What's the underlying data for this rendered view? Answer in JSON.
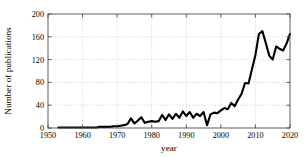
{
  "chart_data": {
    "type": "line",
    "title": "",
    "xlabel": "year",
    "ylabel": "Number of publications",
    "xlim": [
      1950,
      2020
    ],
    "ylim": [
      0,
      200
    ],
    "xticks": [
      1950,
      1960,
      1970,
      1980,
      1990,
      2000,
      2010,
      2020
    ],
    "yticks": [
      0,
      40,
      80,
      120,
      160,
      200
    ],
    "grid": true,
    "legend": null,
    "line_color": "#000000",
    "series": [
      {
        "name": "publications",
        "x": [
          1953,
          1954,
          1955,
          1956,
          1957,
          1958,
          1959,
          1960,
          1961,
          1962,
          1963,
          1964,
          1965,
          1966,
          1967,
          1968,
          1969,
          1970,
          1971,
          1972,
          1973,
          1974,
          1975,
          1976,
          1977,
          1978,
          1979,
          1980,
          1981,
          1982,
          1983,
          1984,
          1985,
          1986,
          1987,
          1988,
          1989,
          1990,
          1991,
          1992,
          1993,
          1994,
          1995,
          1996,
          1997,
          1998,
          1999,
          2000,
          2001,
          2002,
          2003,
          2004,
          2005,
          2006,
          2007,
          2008,
          2009,
          2010,
          2011,
          2012,
          2013,
          2014,
          2015,
          2016,
          2017,
          2018,
          2019,
          2020
        ],
        "values": [
          1,
          1,
          1,
          1,
          1,
          1,
          1,
          1,
          1,
          1,
          1,
          1,
          2,
          2,
          2,
          2,
          3,
          3,
          4,
          5,
          7,
          17,
          8,
          13,
          19,
          9,
          11,
          12,
          11,
          12,
          23,
          14,
          24,
          16,
          25,
          18,
          29,
          21,
          28,
          18,
          25,
          21,
          28,
          5,
          24,
          27,
          26,
          31,
          35,
          33,
          44,
          38,
          50,
          60,
          79,
          78,
          103,
          128,
          165,
          170,
          149,
          127,
          120,
          143,
          139,
          136,
          148,
          165
        ]
      }
    ]
  },
  "axis": {
    "x_tick_labels": [
      "1950",
      "1960",
      "1970",
      "1980",
      "1990",
      "2000",
      "2010",
      "2020"
    ],
    "y_tick_labels": [
      "0",
      "40",
      "80",
      "120",
      "160",
      "200"
    ],
    "x_axis_title": "year",
    "y_axis_title": "Number of publications"
  }
}
